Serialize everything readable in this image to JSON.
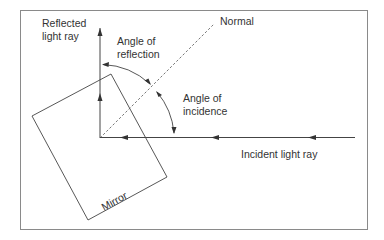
{
  "diagram": {
    "labels": {
      "reflected_ray_line1": "Reflected",
      "reflected_ray_line2": "light ray",
      "angle_reflection_line1": "Angle of",
      "angle_reflection_line2": "reflection",
      "normal": "Normal",
      "angle_incidence_line1": "Angle of",
      "angle_incidence_line2": "incidence",
      "incident_ray": "Incident light ray",
      "mirror": "Mirror"
    },
    "colors": {
      "line": "#444444",
      "frame": "#888888",
      "text": "#333333",
      "background": "#ffffff"
    }
  }
}
